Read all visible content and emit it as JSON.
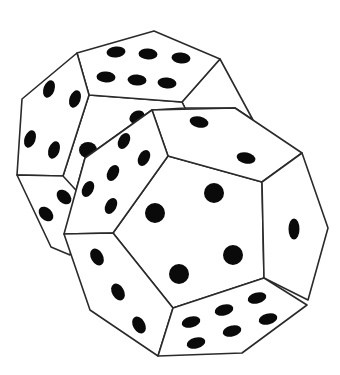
{
  "title": "Two dodecahedral dice",
  "colors": {
    "background": "#ffffff",
    "outline": "#2a2a2a",
    "pip": "#0a0a0a"
  },
  "dice": [
    {
      "name": "back-die",
      "faces": [
        {
          "name": "top",
          "pips": 6
        },
        {
          "name": "left",
          "pips": 4
        },
        {
          "name": "front-center",
          "pips": 3
        },
        {
          "name": "lower-left",
          "pips": 3
        }
      ]
    },
    {
      "name": "front-die",
      "faces": [
        {
          "name": "center",
          "pips": 5
        },
        {
          "name": "top",
          "pips": 2
        },
        {
          "name": "upper-left",
          "pips": 6
        },
        {
          "name": "right",
          "pips": 1
        },
        {
          "name": "lower-left",
          "pips": 3
        },
        {
          "name": "bottom",
          "pips": 6
        }
      ]
    }
  ]
}
